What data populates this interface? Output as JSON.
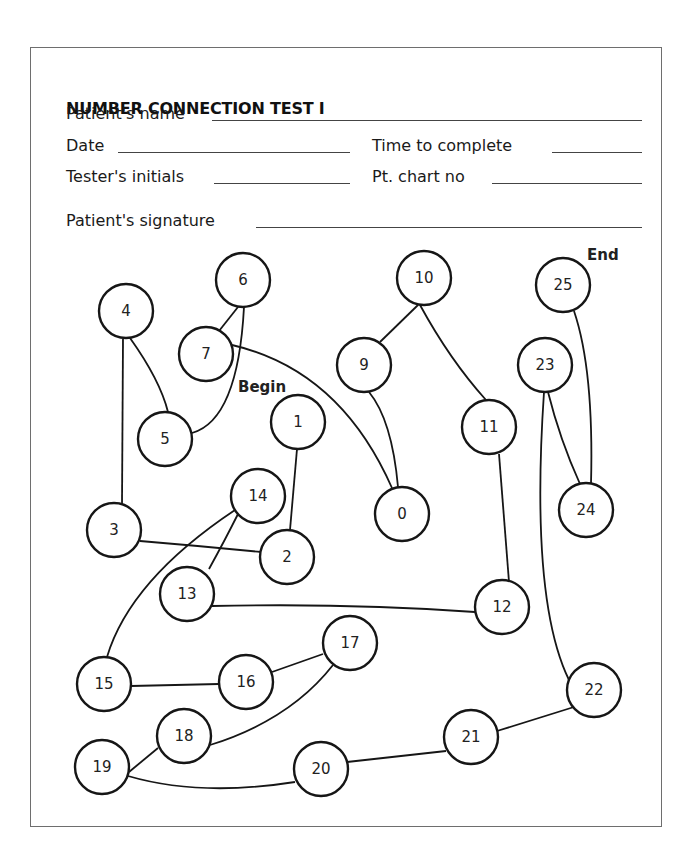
{
  "form": {
    "title": "NUMBER CONNECTION TEST I",
    "fields": {
      "patient_name": {
        "label": "Patient's name",
        "value": ""
      },
      "date": {
        "label": "Date",
        "value": ""
      },
      "time_to_complete": {
        "label": "Time to complete",
        "value": ""
      },
      "testers_initials": {
        "label": "Tester's initials",
        "value": ""
      },
      "pt_chart_no": {
        "label": "Pt. chart no",
        "value": ""
      },
      "patient_signature": {
        "label": "Patient's signature",
        "value": ""
      }
    }
  },
  "markers": {
    "begin": "Begin",
    "end": "End"
  },
  "diagram": {
    "nodes": [
      {
        "label": "1",
        "x": 298,
        "y": 422
      },
      {
        "label": "2",
        "x": 287,
        "y": 557
      },
      {
        "label": "3",
        "x": 114,
        "y": 530
      },
      {
        "label": "4",
        "x": 126,
        "y": 311
      },
      {
        "label": "5",
        "x": 165,
        "y": 439
      },
      {
        "label": "6",
        "x": 243,
        "y": 280
      },
      {
        "label": "7",
        "x": 206,
        "y": 354
      },
      {
        "label": "0",
        "x": 402,
        "y": 514
      },
      {
        "label": "9",
        "x": 364,
        "y": 365
      },
      {
        "label": "10",
        "x": 424,
        "y": 278
      },
      {
        "label": "11",
        "x": 489,
        "y": 427
      },
      {
        "label": "12",
        "x": 502,
        "y": 607
      },
      {
        "label": "13",
        "x": 187,
        "y": 594
      },
      {
        "label": "14",
        "x": 258,
        "y": 496
      },
      {
        "label": "15",
        "x": 104,
        "y": 684
      },
      {
        "label": "16",
        "x": 246,
        "y": 682
      },
      {
        "label": "17",
        "x": 350,
        "y": 643
      },
      {
        "label": "18",
        "x": 184,
        "y": 736
      },
      {
        "label": "19",
        "x": 102,
        "y": 767
      },
      {
        "label": "20",
        "x": 321,
        "y": 769
      },
      {
        "label": "21",
        "x": 471,
        "y": 737
      },
      {
        "label": "22",
        "x": 594,
        "y": 690
      },
      {
        "label": "23",
        "x": 545,
        "y": 365
      },
      {
        "label": "24",
        "x": 586,
        "y": 510
      },
      {
        "label": "25",
        "x": 563,
        "y": 285
      }
    ],
    "node_radius": 27
  }
}
